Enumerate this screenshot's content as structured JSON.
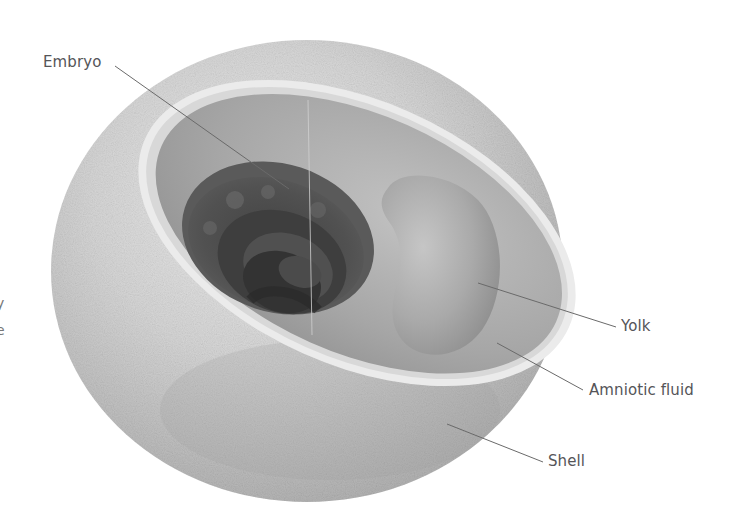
{
  "figure": {
    "title": "",
    "colors": {
      "background": "#ffffff",
      "shell_light": "#e6e6e6",
      "shell_mid": "#c9c9c9",
      "shell_dark": "#a8a8a8",
      "membrane_rim": "#e9e9e9",
      "amniotic_fluid": "#a9a9a9",
      "yolk": "#b7b7b7",
      "embryo_dark": "#444444",
      "leader_line": "#6a6a6a",
      "label_text": "#555558"
    }
  },
  "labels": [
    {
      "id": "embryo",
      "text": "Embryo"
    },
    {
      "id": "yolk",
      "text": "Yolk"
    },
    {
      "id": "amniotic_fluid",
      "text": "Amniotic fluid"
    },
    {
      "id": "shell",
      "text": "Shell"
    }
  ],
  "edge_fragments": [
    {
      "id": "frag1",
      "text": "y"
    },
    {
      "id": "frag2",
      "text": "e"
    }
  ]
}
